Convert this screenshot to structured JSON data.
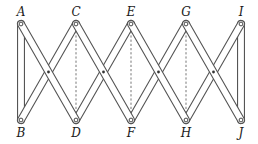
{
  "diagram": {
    "type": "lazy-tongs linkage",
    "top_labels": [
      {
        "text": "A",
        "x": 21,
        "y": 6
      },
      {
        "text": "C",
        "x": 76,
        "y": 6
      },
      {
        "text": "E",
        "x": 131,
        "y": 6
      },
      {
        "text": "G",
        "x": 186,
        "y": 6
      },
      {
        "text": "I",
        "x": 241,
        "y": 6
      }
    ],
    "bottom_labels": [
      {
        "text": "B",
        "x": 21,
        "y": 127
      },
      {
        "text": "D",
        "x": 76,
        "y": 127
      },
      {
        "text": "F",
        "x": 131,
        "y": 127
      },
      {
        "text": "H",
        "x": 186,
        "y": 127
      },
      {
        "text": "J",
        "x": 241,
        "y": 127
      }
    ],
    "top_pivots_x": [
      21,
      76,
      131,
      186,
      241
    ],
    "bottom_pivots_x": [
      21,
      76,
      131,
      186,
      241
    ],
    "top_y": 24,
    "bottom_y": 120,
    "cross_pivots_x": [
      48.5,
      103.5,
      158.5,
      213.5
    ],
    "cross_y": 72,
    "dashed_lines": [
      "C-D",
      "E-F",
      "G-H"
    ],
    "end_bars": [
      "A-B",
      "I-J"
    ],
    "colors": {
      "stroke": "#555555",
      "dashed": "#666666",
      "label": "#1a1a1a",
      "background": "#ffffff"
    }
  }
}
